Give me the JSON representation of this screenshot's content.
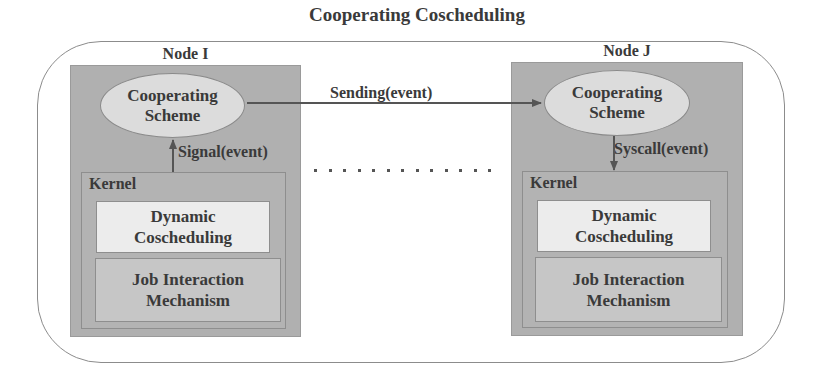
{
  "diagram": {
    "title": "Cooperating Coscheduling",
    "nodes": [
      {
        "label": "Node I",
        "scheme": {
          "line1": "Cooperating",
          "line2": "Scheme"
        },
        "kernel": {
          "label": "Kernel",
          "dynamic": {
            "line1": "Dynamic",
            "line2": "Coscheduling"
          },
          "job": {
            "line1": "Job Interaction",
            "line2": "Mechanism"
          }
        }
      },
      {
        "label": "Node J",
        "scheme": {
          "line1": "Cooperating",
          "line2": "Scheme"
        },
        "kernel": {
          "label": "Kernel",
          "dynamic": {
            "line1": "Dynamic",
            "line2": "Coscheduling"
          },
          "job": {
            "line1": "Job Interaction",
            "line2": "Mechanism"
          }
        }
      }
    ],
    "edges": [
      {
        "label": "Sending(event)",
        "from": "Node I Cooperating Scheme",
        "to": "Node J Cooperating Scheme",
        "direction": "right"
      },
      {
        "label": "Signal(event)",
        "from": "Node I Kernel",
        "to": "Node I Cooperating Scheme",
        "direction": "up"
      },
      {
        "label": "Syscall(event)",
        "from": "Node J Cooperating Scheme",
        "to": "Node J Kernel",
        "direction": "down"
      }
    ],
    "ellipsis": "more nodes (dotted line)",
    "colors": {
      "node_fill": "#b0b0b0",
      "ellipse_fill": "#dcdcdc",
      "dynamic_fill": "#ececec",
      "job_fill": "#c6c6c6",
      "text": "#3a3a3a",
      "line": "#555555"
    }
  }
}
